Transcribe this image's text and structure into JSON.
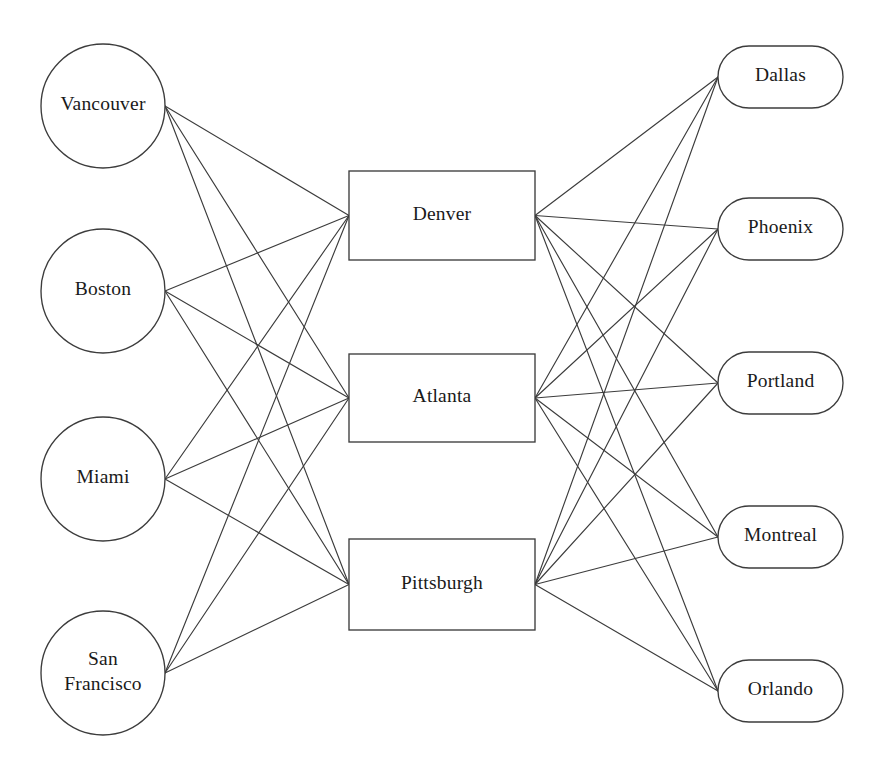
{
  "diagram": {
    "background_color": "#ffffff",
    "line_color": "#3c3c3c",
    "node_fill": "#ffffff",
    "node_stroke": "#3c3c3c",
    "text_color": "#1a1a1a",
    "layers": [
      {
        "name": "sources",
        "shape": "circle",
        "nodes": [
          {
            "id": "vancouver",
            "label": "Vancouver",
            "lines": [
              "Vancouver"
            ],
            "cx": 103,
            "cy": 106,
            "r": 62
          },
          {
            "id": "boston",
            "label": "Boston",
            "lines": [
              "Boston"
            ],
            "cx": 103,
            "cy": 291,
            "r": 62
          },
          {
            "id": "miami",
            "label": "Miami",
            "lines": [
              "Miami"
            ],
            "cx": 103,
            "cy": 479,
            "r": 62
          },
          {
            "id": "san-francisco",
            "label": "San Francisco",
            "lines": [
              "San",
              "Francisco"
            ],
            "cx": 103,
            "cy": 673,
            "r": 62
          }
        ]
      },
      {
        "name": "hubs",
        "shape": "rectangle",
        "nodes": [
          {
            "id": "denver",
            "label": "Denver",
            "lines": [
              "Denver"
            ],
            "x": 349,
            "y": 171,
            "width": 186,
            "height": 89
          },
          {
            "id": "atlanta",
            "label": "Atlanta",
            "lines": [
              "Atlanta"
            ],
            "x": 349,
            "y": 354,
            "width": 186,
            "height": 88
          },
          {
            "id": "pittsburgh",
            "label": "Pittsburgh",
            "lines": [
              "Pittsburgh"
            ],
            "x": 349,
            "y": 539,
            "width": 186,
            "height": 91
          }
        ]
      },
      {
        "name": "destinations",
        "shape": "stadium",
        "nodes": [
          {
            "id": "dallas",
            "label": "Dallas",
            "lines": [
              "Dallas"
            ],
            "x": 718,
            "y": 46,
            "width": 125,
            "height": 62
          },
          {
            "id": "phoenix",
            "label": "Phoenix",
            "lines": [
              "Phoenix"
            ],
            "x": 718,
            "y": 198,
            "width": 125,
            "height": 62
          },
          {
            "id": "portland",
            "label": "Portland",
            "lines": [
              "Portland"
            ],
            "x": 718,
            "y": 352,
            "width": 125,
            "height": 62
          },
          {
            "id": "montreal",
            "label": "Montreal",
            "lines": [
              "Montreal"
            ],
            "x": 718,
            "y": 506,
            "width": 125,
            "height": 62
          },
          {
            "id": "orlando",
            "label": "Orlando",
            "lines": [
              "Orlando"
            ],
            "x": 718,
            "y": 660,
            "width": 125,
            "height": 62
          }
        ]
      }
    ],
    "edges": [
      {
        "from": "vancouver",
        "to": "denver"
      },
      {
        "from": "vancouver",
        "to": "atlanta"
      },
      {
        "from": "vancouver",
        "to": "pittsburgh"
      },
      {
        "from": "boston",
        "to": "denver"
      },
      {
        "from": "boston",
        "to": "atlanta"
      },
      {
        "from": "boston",
        "to": "pittsburgh"
      },
      {
        "from": "miami",
        "to": "denver"
      },
      {
        "from": "miami",
        "to": "atlanta"
      },
      {
        "from": "miami",
        "to": "pittsburgh"
      },
      {
        "from": "san-francisco",
        "to": "denver"
      },
      {
        "from": "san-francisco",
        "to": "atlanta"
      },
      {
        "from": "san-francisco",
        "to": "pittsburgh"
      },
      {
        "from": "denver",
        "to": "dallas"
      },
      {
        "from": "denver",
        "to": "phoenix"
      },
      {
        "from": "denver",
        "to": "portland"
      },
      {
        "from": "denver",
        "to": "montreal"
      },
      {
        "from": "denver",
        "to": "orlando"
      },
      {
        "from": "atlanta",
        "to": "dallas"
      },
      {
        "from": "atlanta",
        "to": "phoenix"
      },
      {
        "from": "atlanta",
        "to": "portland"
      },
      {
        "from": "atlanta",
        "to": "montreal"
      },
      {
        "from": "atlanta",
        "to": "orlando"
      },
      {
        "from": "pittsburgh",
        "to": "dallas"
      },
      {
        "from": "pittsburgh",
        "to": "phoenix"
      },
      {
        "from": "pittsburgh",
        "to": "portland"
      },
      {
        "from": "pittsburgh",
        "to": "montreal"
      },
      {
        "from": "pittsburgh",
        "to": "orlando"
      }
    ]
  }
}
